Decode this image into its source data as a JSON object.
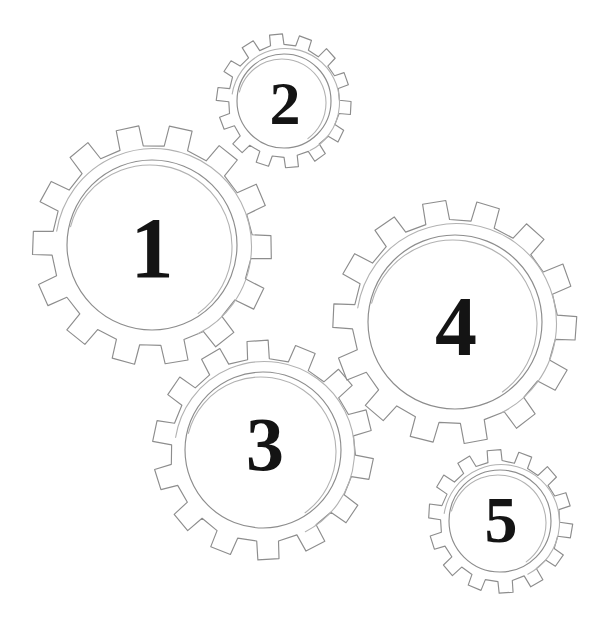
{
  "illustration": {
    "title": "Numbered gears line drawing",
    "background_color": "#ffffff",
    "stroke_color": "#8d8d8d",
    "sketch_stroke_color": "#b2b2b2",
    "label_color": "#141414",
    "canvas": {
      "width": 607,
      "height": 622
    }
  },
  "gears": [
    {
      "label": "1",
      "cx": 152,
      "cy": 245,
      "outer_radius": 120,
      "root_radius": 100,
      "hub_radius": 85,
      "teeth": 14,
      "rotation": 1,
      "label_x": 152,
      "label_y": 248,
      "label_size": 86
    },
    {
      "label": "2",
      "cx": 284,
      "cy": 101,
      "outer_radius": 67,
      "root_radius": 56,
      "hub_radius": 47,
      "teeth": 14,
      "rotation": 6,
      "label_x": 285,
      "label_y": 103,
      "label_size": 62
    },
    {
      "label": "3",
      "cx": 263,
      "cy": 450,
      "outer_radius": 110,
      "root_radius": 92,
      "hub_radius": 78,
      "teeth": 14,
      "rotation": 10,
      "label_x": 265,
      "label_y": 444,
      "label_size": 76
    },
    {
      "label": "4",
      "cx": 455,
      "cy": 322,
      "outer_radius": 122,
      "root_radius": 102,
      "hub_radius": 87,
      "teeth": 14,
      "rotation": 3,
      "label_x": 456,
      "label_y": 326,
      "label_size": 84
    },
    {
      "label": "5",
      "cx": 500,
      "cy": 521,
      "outer_radius": 72,
      "root_radius": 60,
      "hub_radius": 51,
      "teeth": 14,
      "rotation": 8,
      "label_x": 501,
      "label_y": 519,
      "label_size": 66
    }
  ]
}
